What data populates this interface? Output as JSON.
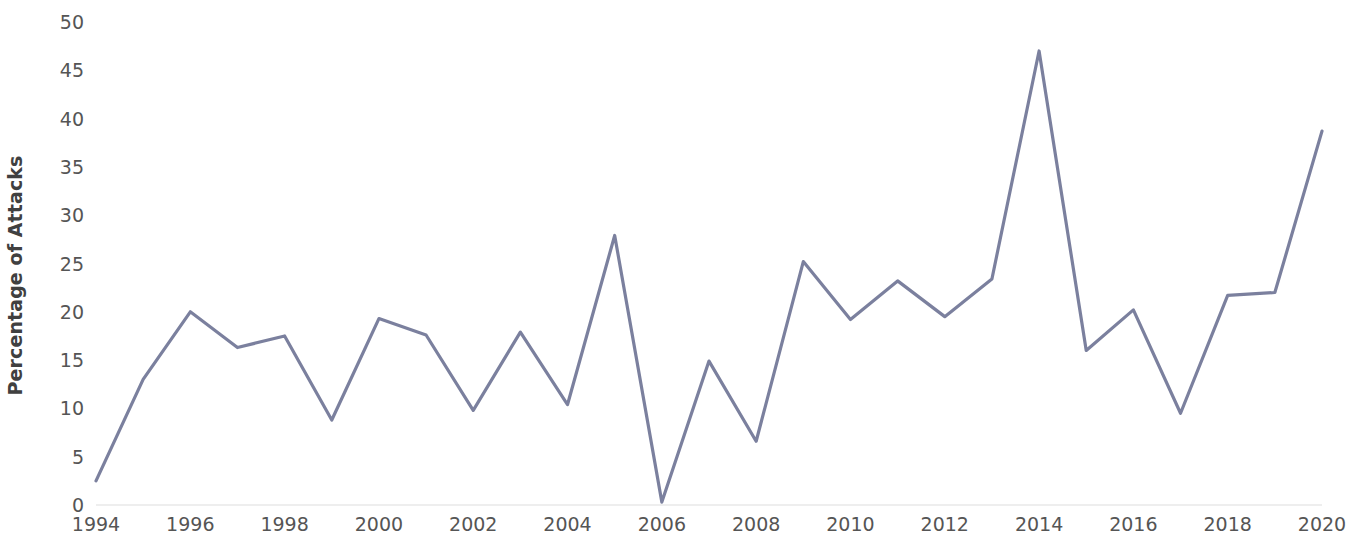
{
  "chart_data": {
    "type": "line",
    "title": "",
    "subtitle": "",
    "xlabel": "",
    "ylabel": "Percentage of Attacks",
    "xlim": [
      1994,
      2020
    ],
    "ylim": [
      0,
      50
    ],
    "grid": false,
    "legend": null,
    "legend_position": "none",
    "line_color": "#7b809e",
    "line_width": 3,
    "markers": false,
    "x": [
      1994,
      1995,
      1996,
      1997,
      1998,
      1999,
      2000,
      2001,
      2002,
      2003,
      2004,
      2005,
      2006,
      2007,
      2008,
      2009,
      2010,
      2011,
      2012,
      2013,
      2014,
      2015,
      2016,
      2017,
      2018,
      2019,
      2020
    ],
    "values": [
      2.5,
      13.0,
      20.0,
      16.3,
      17.5,
      8.8,
      19.3,
      17.6,
      9.8,
      17.9,
      10.4,
      27.9,
      0.3,
      14.9,
      6.6,
      25.2,
      19.2,
      23.2,
      19.5,
      23.4,
      47.0,
      16.0,
      20.2,
      9.5,
      21.7,
      22.0,
      38.7
    ],
    "series": [
      {
        "name": "Percentage of Attacks",
        "color": "#7b809e",
        "values": [
          2.5,
          13.0,
          20.0,
          16.3,
          17.5,
          8.8,
          19.3,
          17.6,
          9.8,
          17.9,
          10.4,
          27.9,
          0.3,
          14.9,
          6.6,
          25.2,
          19.2,
          23.2,
          19.5,
          23.4,
          47.0,
          16.0,
          20.2,
          9.5,
          21.7,
          22.0,
          38.7
        ]
      }
    ],
    "y_ticks": [
      0,
      5,
      10,
      15,
      20,
      25,
      30,
      35,
      40,
      45,
      50
    ],
    "y_tick_labels": [
      "0",
      "5",
      "10",
      "15",
      "20",
      "25",
      "30",
      "35",
      "40",
      "45",
      "50"
    ],
    "x_ticks": [
      1994,
      1996,
      1998,
      2000,
      2002,
      2004,
      2006,
      2008,
      2010,
      2012,
      2014,
      2016,
      2018,
      2020
    ],
    "x_tick_labels": [
      "1994",
      "1996",
      "1998",
      "2000",
      "2002",
      "2004",
      "2006",
      "2008",
      "2010",
      "2012",
      "2014",
      "2016",
      "2018",
      "2020"
    ],
    "axis_line_color": "#e8e8e8"
  }
}
